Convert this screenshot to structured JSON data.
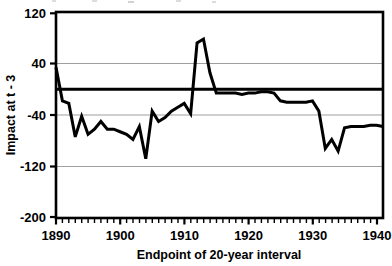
{
  "figure": {
    "kind": "line-chart",
    "background_color": "#ffffff",
    "ink_color": "#000000",
    "gridline_color": "#b0b0b0",
    "frame_color": "#000000"
  },
  "chart_data": {
    "type": "line",
    "title": "",
    "subtitle": "",
    "xlabel": "Endpoint of 20-year interval",
    "ylabel": "Impact at t - 3",
    "xlim": [
      1890,
      1941
    ],
    "ylim": [
      -200,
      120
    ],
    "grid": true,
    "grid_axis": "y",
    "legend": false,
    "legend_position": "none",
    "zero_line": true,
    "x_major_ticks": [
      1890,
      1900,
      1910,
      1920,
      1930,
      1940
    ],
    "x_major_tick_labels": [
      "1890",
      "1900",
      "1910",
      "1920",
      "1930",
      "1940"
    ],
    "x_minor_tick_step": 1,
    "y_ticks": [
      120,
      40,
      -40,
      -120,
      -200
    ],
    "y_tick_labels": [
      "120",
      "40",
      "-40",
      "-120",
      "-200"
    ],
    "series": [
      {
        "name": "Impact at t - 3",
        "color": "#000000",
        "line_width": 3,
        "x": [
          1890,
          1891,
          1892,
          1893,
          1894,
          1895,
          1896,
          1897,
          1898,
          1899,
          1900,
          1901,
          1902,
          1903,
          1904,
          1905,
          1906,
          1907,
          1908,
          1909,
          1910,
          1911,
          1912,
          1913,
          1914,
          1915,
          1916,
          1917,
          1918,
          1919,
          1920,
          1921,
          1922,
          1923,
          1924,
          1925,
          1926,
          1927,
          1928,
          1929,
          1930,
          1931,
          1932,
          1933,
          1934,
          1935,
          1936,
          1937,
          1938,
          1939,
          1940,
          1941
        ],
        "values": [
          34,
          -18,
          -22,
          -74,
          -42,
          -70,
          -62,
          -50,
          -62,
          -62,
          -66,
          -70,
          -78,
          -58,
          -108,
          -34,
          -50,
          -44,
          -34,
          -28,
          -22,
          -38,
          72,
          78,
          26,
          -6,
          -6,
          -6,
          -6,
          -8,
          -6,
          -6,
          -4,
          -4,
          -6,
          -18,
          -20,
          -20,
          -20,
          -20,
          -18,
          -34,
          -92,
          -78,
          -96,
          -60,
          -58,
          -58,
          -58,
          -56,
          -56,
          -58
        ]
      }
    ]
  },
  "axes": {
    "y_axis_title": "Impact at t - 3",
    "x_axis_title": "Endpoint of 20-year interval"
  },
  "labels": {
    "y_120": "120",
    "y_40": "40",
    "y_m40": "-40",
    "y_m120": "-120",
    "y_m200": "-200",
    "x_1890": "1890",
    "x_1900": "1900",
    "x_1910": "1910",
    "x_1920": "1920",
    "x_1930": "1930",
    "x_1940": "1940"
  }
}
